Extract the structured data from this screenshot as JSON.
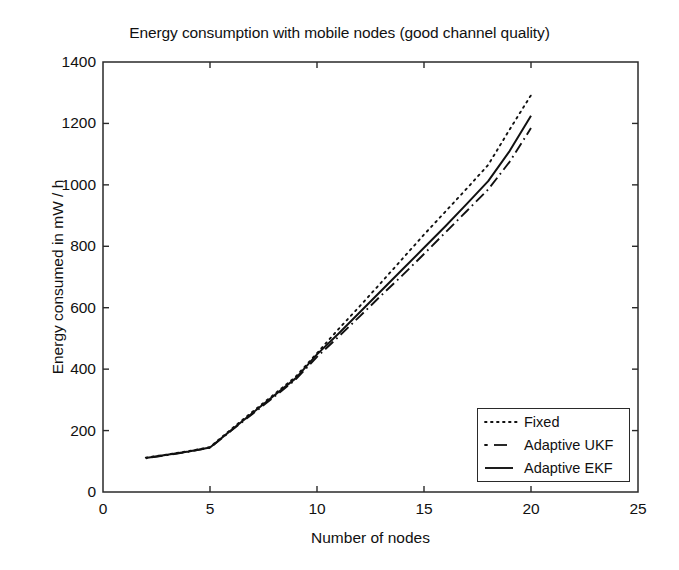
{
  "chart_data": {
    "type": "line",
    "title": "Energy consumption with mobile nodes (good channel quality)",
    "xlabel": "Number of nodes",
    "ylabel": "Energy consumed in mW / h",
    "xlim": [
      0,
      25
    ],
    "ylim": [
      0,
      1400
    ],
    "xticks": [
      0,
      5,
      10,
      15,
      20,
      25
    ],
    "yticks": [
      0,
      200,
      400,
      600,
      800,
      1000,
      1200,
      1400
    ],
    "xtick_labels": [
      "0",
      "5",
      "10",
      "15",
      "20",
      "25"
    ],
    "ytick_labels": [
      "0",
      "200",
      "400",
      "600",
      "800",
      "1000",
      "1200",
      "1400"
    ],
    "grid": false,
    "legend_position": "lower right",
    "x": [
      2,
      3,
      4,
      5,
      6,
      7,
      8,
      9,
      10,
      11,
      12,
      13,
      14,
      15,
      16,
      17,
      18,
      19,
      20
    ],
    "series": [
      {
        "name": "Fixed",
        "style": "dotted",
        "color": "#111111",
        "values": [
          112,
          122,
          133,
          146,
          205,
          262,
          318,
          375,
          452,
          530,
          605,
          682,
          760,
          838,
          913,
          988,
          1065,
          1180,
          1292
        ]
      },
      {
        "name": "Adaptive UKF",
        "style": "dashdot",
        "color": "#111111",
        "values": [
          110,
          120,
          131,
          144,
          200,
          255,
          310,
          366,
          440,
          505,
          572,
          640,
          706,
          775,
          845,
          915,
          985,
          1075,
          1185
        ]
      },
      {
        "name": "Adaptive EKF",
        "style": "solid",
        "color": "#111111",
        "values": [
          111,
          121,
          132,
          145,
          202,
          258,
          314,
          370,
          448,
          515,
          585,
          655,
          725,
          795,
          865,
          938,
          1012,
          1110,
          1225
        ]
      }
    ]
  },
  "legend": {
    "items": [
      {
        "label": "Fixed",
        "sample": "dotted-line-sample"
      },
      {
        "label": "Adaptive UKF",
        "sample": "dashdot-line-sample"
      },
      {
        "label": "Adaptive EKF",
        "sample": "solid-line-sample"
      }
    ]
  },
  "colors": {
    "ink": "#111111",
    "axis": "#2a2a2a",
    "background": "#ffffff"
  }
}
